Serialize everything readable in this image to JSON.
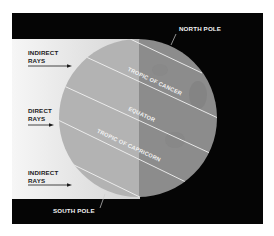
{
  "diagram": {
    "colors": {
      "background": "#ffffff",
      "frame": "#050505",
      "light_band_left": "#f4f4f4",
      "light_band_right": "#d6d6d6",
      "globe_lit": "#b3b3b3",
      "globe_shadow": "#8c8c8c",
      "latitude_line": "#f2f2f2",
      "label_dark": "#1a1a1a",
      "label_light": "#f2f2f2"
    },
    "poles": {
      "north": "NORTH POLE",
      "south": "SOUTH POLE"
    },
    "latitudes": {
      "tropic_of_cancer": "TROPIC OF CANCER",
      "equator": "EQUATOR",
      "tropic_of_capricorn": "TROPIC OF CAPRICORN"
    },
    "rays": [
      {
        "line1": "INDIRECT",
        "line2": "RAYS"
      },
      {
        "line1": "DIRECT",
        "line2": "RAYS"
      },
      {
        "line1": "INDIRECT",
        "line2": "RAYS"
      }
    ]
  }
}
